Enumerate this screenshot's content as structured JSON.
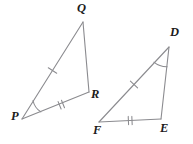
{
  "figure": {
    "kind": "geometry-diagram",
    "canvas": {
      "width": 193,
      "height": 144,
      "background": "#ffffff"
    },
    "stroke_color": "#8b8b8f",
    "label_color": "#1b1b1b",
    "triangles": [
      {
        "id": "triangle-pqr",
        "name": "Triangle PQR",
        "vertices": [
          {
            "key": "P",
            "label": "P",
            "x": 22,
            "y": 119,
            "label_x": 11,
            "label_y": 122
          },
          {
            "key": "Q",
            "label": "Q",
            "x": 83,
            "y": 22,
            "label_x": 77,
            "label_y": 3
          },
          {
            "key": "R",
            "label": "R",
            "x": 89,
            "y": 92,
            "label_x": 91,
            "label_y": 90
          }
        ],
        "edges": [
          {
            "from": "P",
            "to": "Q",
            "ticks": 1
          },
          {
            "from": "Q",
            "to": "R",
            "ticks": 0
          },
          {
            "from": "P",
            "to": "R",
            "ticks": 2
          }
        ],
        "marked_angle": {
          "at": "P",
          "arcs": 1
        }
      },
      {
        "id": "triangle-fde",
        "name": "Triangle FDE",
        "vertices": [
          {
            "key": "F",
            "label": "F",
            "x": 99,
            "y": 122,
            "label_x": 93,
            "label_y": 124
          },
          {
            "key": "D",
            "label": "D",
            "x": 169,
            "y": 47,
            "label_x": 170,
            "label_y": 26
          },
          {
            "key": "E",
            "label": "E",
            "x": 161,
            "y": 119,
            "label_x": 161,
            "label_y": 122
          }
        ],
        "edges": [
          {
            "from": "F",
            "to": "D",
            "ticks": 1
          },
          {
            "from": "D",
            "to": "E",
            "ticks": 0
          },
          {
            "from": "F",
            "to": "E",
            "ticks": 2
          }
        ],
        "marked_angle": {
          "at": "D",
          "arcs": 1
        }
      }
    ]
  }
}
